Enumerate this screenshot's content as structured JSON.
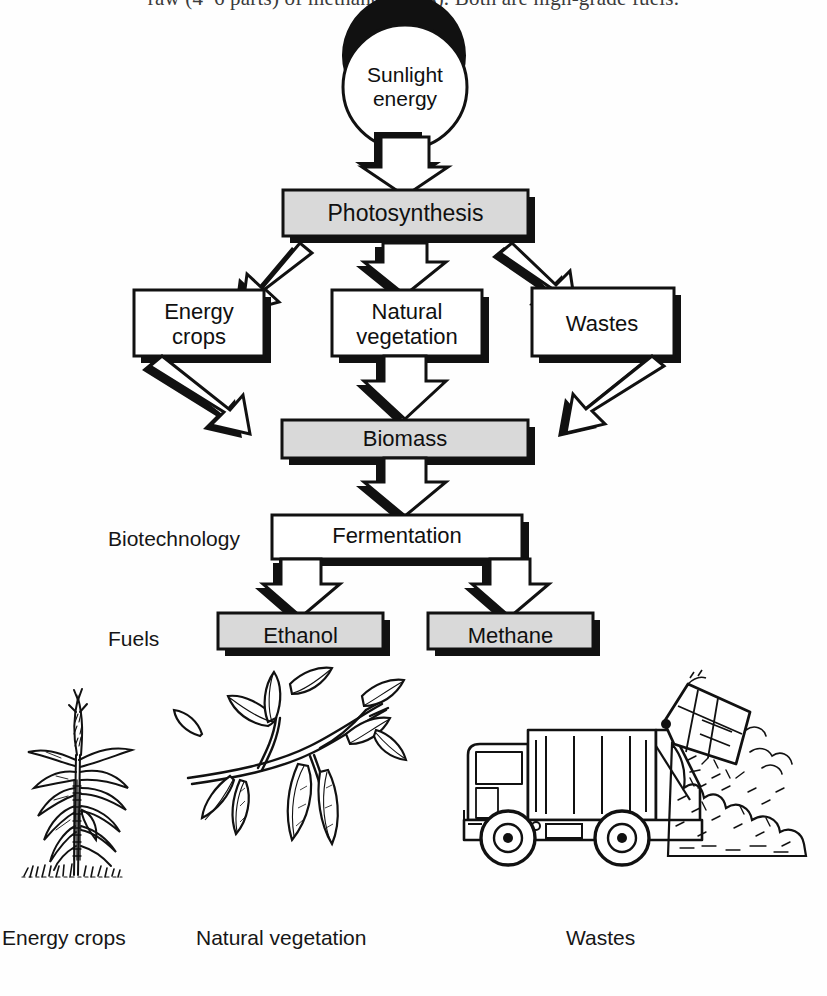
{
  "page": {
    "cropped_header_text": "raw (4–6 parts) of methane (a gas). Both are high-grade fuels."
  },
  "diagram": {
    "nodes": {
      "sunlight": {
        "label": "Sunlight\nenergy",
        "shape": "circle",
        "fill": "white"
      },
      "photosynthesis": {
        "label": "Photosynthesis",
        "shape": "box",
        "fill": "#d9d9d9"
      },
      "energy_crops": {
        "label": "Energy\ncrops",
        "shape": "box",
        "fill": "white"
      },
      "natural_vegetation": {
        "label": "Natural\nvegetation",
        "shape": "box",
        "fill": "white"
      },
      "wastes": {
        "label": "Wastes",
        "shape": "box",
        "fill": "white"
      },
      "biomass": {
        "label": "Biomass",
        "shape": "box",
        "fill": "#d9d9d9"
      },
      "fermentation": {
        "label": "Fermentation",
        "shape": "box",
        "fill": "white"
      },
      "ethanol": {
        "label": "Ethanol",
        "shape": "box",
        "fill": "#d9d9d9"
      },
      "methane": {
        "label": "Methane",
        "shape": "box",
        "fill": "#d9d9d9"
      }
    },
    "row_labels": {
      "biotechnology": "Biotechnology",
      "fuels": "Fuels"
    },
    "flows": [
      {
        "from": "sunlight",
        "to": "photosynthesis"
      },
      {
        "from": "photosynthesis",
        "to": "energy_crops"
      },
      {
        "from": "photosynthesis",
        "to": "natural_vegetation"
      },
      {
        "from": "photosynthesis",
        "to": "wastes"
      },
      {
        "from": "energy_crops",
        "to": "biomass"
      },
      {
        "from": "natural_vegetation",
        "to": "biomass"
      },
      {
        "from": "wastes",
        "to": "biomass"
      },
      {
        "from": "biomass",
        "to": "fermentation"
      },
      {
        "from": "fermentation",
        "to": "ethanol"
      },
      {
        "from": "fermentation",
        "to": "methane"
      }
    ]
  },
  "illustrations": [
    {
      "name": "corn-plant",
      "caption": "Energy crops"
    },
    {
      "name": "leafy-branch",
      "caption": "Natural vegetation"
    },
    {
      "name": "garbage-truck",
      "caption": "Wastes"
    }
  ],
  "colors": {
    "ink": "#101010",
    "shaded_fill": "#d9d9d9",
    "paper": "#fefefe"
  }
}
